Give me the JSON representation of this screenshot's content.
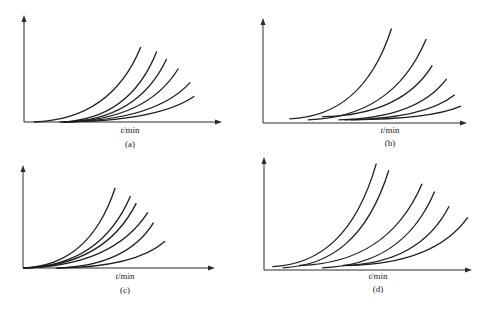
{
  "chart_data": [
    {
      "type": "line",
      "panel": "(a)",
      "xlabel": "t/min",
      "xlabel_italic_part": "t",
      "xlabel_rest": "/min",
      "ylabel": "",
      "caption": "(a)",
      "ticks": false,
      "xlim": [
        0,
        1
      ],
      "ylim": [
        0,
        1
      ],
      "series": [
        {
          "name": "curve-1",
          "start": [
            0.05,
            0.0
          ],
          "end": [
            0.59,
            0.7
          ],
          "shape": "exponential"
        },
        {
          "name": "curve-2",
          "start": [
            0.18,
            0.0
          ],
          "end": [
            0.67,
            0.66
          ],
          "shape": "exponential"
        },
        {
          "name": "curve-3",
          "start": [
            0.2,
            0.0
          ],
          "end": [
            0.72,
            0.59
          ],
          "shape": "exponential"
        },
        {
          "name": "curve-4",
          "start": [
            0.2,
            0.0
          ],
          "end": [
            0.78,
            0.5
          ],
          "shape": "exponential"
        },
        {
          "name": "curve-5",
          "start": [
            0.2,
            0.0
          ],
          "end": [
            0.84,
            0.37
          ],
          "shape": "exponential"
        },
        {
          "name": "curve-6",
          "start": [
            0.2,
            0.0
          ],
          "end": [
            0.86,
            0.24
          ],
          "shape": "exponential"
        }
      ]
    },
    {
      "type": "line",
      "panel": "(b)",
      "xlabel": "t/min",
      "xlabel_italic_part": "t",
      "xlabel_rest": "/min",
      "ylabel": "",
      "caption": "(b)",
      "ticks": false,
      "xlim": [
        0,
        1
      ],
      "ylim": [
        0,
        1
      ],
      "series": [
        {
          "name": "curve-1",
          "start": [
            0.13,
            0.04
          ],
          "end": [
            0.63,
            0.9
          ],
          "shape": "exponential"
        },
        {
          "name": "curve-2",
          "start": [
            0.22,
            0.03
          ],
          "end": [
            0.8,
            0.8
          ],
          "shape": "exponential"
        },
        {
          "name": "curve-3",
          "start": [
            0.29,
            0.06
          ],
          "end": [
            0.83,
            0.55
          ],
          "shape": "exponential"
        },
        {
          "name": "curve-4",
          "start": [
            0.37,
            0.03
          ],
          "end": [
            0.9,
            0.42
          ],
          "shape": "exponential"
        },
        {
          "name": "curve-5",
          "start": [
            0.4,
            0.03
          ],
          "end": [
            0.94,
            0.27
          ],
          "shape": "exponential"
        },
        {
          "name": "curve-6",
          "start": [
            0.43,
            0.03
          ],
          "end": [
            0.97,
            0.16
          ],
          "shape": "exponential"
        }
      ]
    },
    {
      "type": "line",
      "panel": "(c)",
      "xlabel": "t/min",
      "xlabel_italic_part": "t",
      "xlabel_rest": "/min",
      "ylabel": "",
      "caption": "(c)",
      "ticks": false,
      "xlim": [
        0,
        1
      ],
      "ylim": [
        0,
        1
      ],
      "series": [
        {
          "name": "curve-1",
          "start": [
            0.0,
            0.0
          ],
          "end": [
            0.48,
            0.78
          ],
          "shape": "exponential"
        },
        {
          "name": "curve-2",
          "start": [
            0.0,
            0.0
          ],
          "end": [
            0.56,
            0.7
          ],
          "shape": "exponential"
        },
        {
          "name": "curve-3",
          "start": [
            0.0,
            0.0
          ],
          "end": [
            0.59,
            0.63
          ],
          "shape": "exponential"
        },
        {
          "name": "curve-4",
          "start": [
            0.0,
            0.0
          ],
          "end": [
            0.65,
            0.54
          ],
          "shape": "exponential"
        },
        {
          "name": "curve-5",
          "start": [
            0.17,
            0.0
          ],
          "end": [
            0.68,
            0.44
          ],
          "shape": "exponential"
        },
        {
          "name": "curve-6",
          "start": [
            0.18,
            0.0
          ],
          "end": [
            0.74,
            0.26
          ],
          "shape": "exponential"
        }
      ]
    },
    {
      "type": "line",
      "panel": "(d)",
      "xlabel": "t/min",
      "xlabel_italic_part": "t",
      "xlabel_rest": "/min",
      "ylabel": "",
      "caption": "(d)",
      "ticks": false,
      "xlim": [
        0,
        1
      ],
      "ylim": [
        0,
        1
      ],
      "series": [
        {
          "name": "curve-1",
          "start": [
            0.04,
            0.03
          ],
          "end": [
            0.54,
            0.95
          ],
          "shape": "exponential"
        },
        {
          "name": "curve-2",
          "start": [
            0.09,
            0.02
          ],
          "end": [
            0.6,
            0.89
          ],
          "shape": "exponential"
        },
        {
          "name": "curve-3",
          "start": [
            0.17,
            0.04
          ],
          "end": [
            0.76,
            0.77
          ],
          "shape": "exponential"
        },
        {
          "name": "curve-4",
          "start": [
            0.28,
            0.02
          ],
          "end": [
            0.82,
            0.7
          ],
          "shape": "exponential"
        },
        {
          "name": "curve-5",
          "start": [
            0.38,
            0.04
          ],
          "end": [
            0.89,
            0.57
          ],
          "shape": "exponential"
        },
        {
          "name": "curve-6",
          "start": [
            0.4,
            0.04
          ],
          "end": [
            0.98,
            0.47
          ],
          "shape": "exponential"
        }
      ]
    }
  ]
}
